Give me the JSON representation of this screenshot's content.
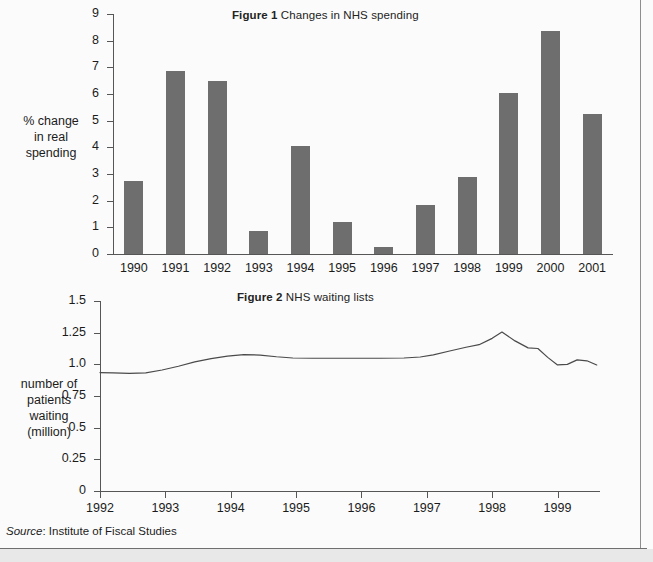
{
  "page": {
    "background_color": "#fbfbfb",
    "bar_color": "#6e6e6e",
    "line_color": "#4a4a4a",
    "axis_color": "#565656"
  },
  "source": {
    "prefix": "Source",
    "text": ": Institute of Fiscal Studies"
  },
  "figure1": {
    "title_bold": "Figure 1",
    "title_rest": "Changes in NHS spending",
    "y_axis_label": "% change\nin real\nspending",
    "y_axis_label_lines": [
      "% change",
      "in real",
      "spending"
    ]
  },
  "figure2": {
    "title_bold": "Figure 2",
    "title_rest": "NHS waiting lists",
    "y_axis_label_lines": [
      "number of",
      "patients",
      "waiting",
      "(million)"
    ]
  },
  "chart_data": [
    {
      "type": "bar",
      "title": "Figure 1 Changes in NHS spending",
      "xlabel": "",
      "ylabel": "% change in real spending",
      "ylim": [
        0,
        9
      ],
      "yticks": [
        "0",
        "1",
        "2",
        "3",
        "4",
        "5",
        "6",
        "7",
        "8",
        "9"
      ],
      "ytick_values": [
        0,
        1,
        2,
        3,
        4,
        5,
        6,
        7,
        8,
        9
      ],
      "grid": false,
      "legend": "none",
      "categories": [
        "1990",
        "1991",
        "1992",
        "1993",
        "1994",
        "1995",
        "1996",
        "1997",
        "1998",
        "1999",
        "2000",
        "2001"
      ],
      "values": [
        2.75,
        6.85,
        6.5,
        0.85,
        4.05,
        1.2,
        0.25,
        1.85,
        2.9,
        6.05,
        8.35,
        5.25
      ]
    },
    {
      "type": "line",
      "title": "Figure 2 NHS waiting lists",
      "xlabel": "",
      "ylabel": "number of patients waiting (million)",
      "ylim": [
        0,
        1.5
      ],
      "yticks": [
        "0",
        "0.25",
        "0.5",
        "0.75",
        "1.0",
        "1.25",
        "1.5"
      ],
      "ytick_values": [
        0,
        0.25,
        0.5,
        0.75,
        1.0,
        1.25,
        1.5
      ],
      "xticks": [
        "1992",
        "1993",
        "1994",
        "1995",
        "1996",
        "1997",
        "1998",
        "1999"
      ],
      "xtick_values": [
        1992,
        1993,
        1994,
        1995,
        1996,
        1997,
        1998,
        1999
      ],
      "xlim": [
        1992,
        1999.65
      ],
      "grid": false,
      "legend": "none",
      "x": [
        1992.0,
        1992.2,
        1992.45,
        1992.7,
        1992.95,
        1993.2,
        1993.45,
        1993.7,
        1993.95,
        1994.2,
        1994.45,
        1994.7,
        1994.95,
        1995.25,
        1995.6,
        1995.95,
        1996.3,
        1996.65,
        1996.9,
        1997.1,
        1997.35,
        1997.6,
        1997.8,
        1998.0,
        1998.15,
        1998.35,
        1998.55,
        1998.7,
        1998.85,
        1999.0,
        1999.15,
        1999.3,
        1999.45,
        1999.6
      ],
      "y": [
        0.935,
        0.932,
        0.928,
        0.933,
        0.955,
        0.985,
        1.02,
        1.045,
        1.065,
        1.077,
        1.073,
        1.06,
        1.05,
        1.048,
        1.048,
        1.048,
        1.048,
        1.05,
        1.058,
        1.075,
        1.105,
        1.135,
        1.155,
        1.205,
        1.255,
        1.185,
        1.13,
        1.125,
        1.055,
        0.995,
        1.0,
        1.035,
        1.028,
        0.995
      ]
    }
  ]
}
